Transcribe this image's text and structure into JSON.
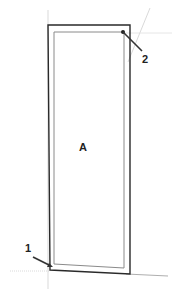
{
  "diagram": {
    "panel_label": "A",
    "callouts": [
      {
        "id": "1",
        "label": "1"
      },
      {
        "id": "2",
        "label": "2"
      }
    ],
    "colors": {
      "outline": "#2a2a2a",
      "inner": "#8a8a8a",
      "guide": "#c8c8c8",
      "text": "#222222"
    }
  }
}
